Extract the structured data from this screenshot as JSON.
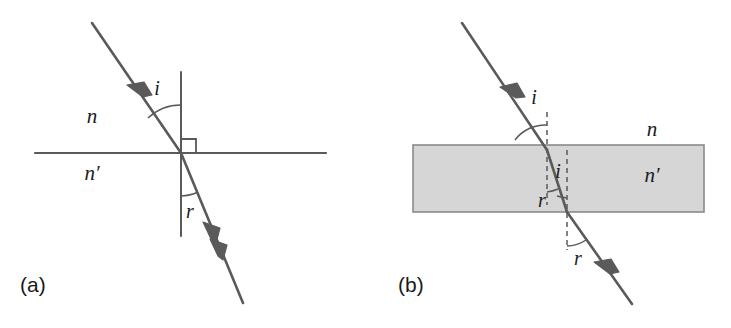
{
  "figure": {
    "width": 731,
    "height": 328,
    "background": "#ffffff",
    "stroke_color": "#5a5a5a",
    "text_color": "#1a1a1a",
    "slab_fill": "#d6d6d6",
    "slab_stroke": "#8a8a8a"
  },
  "panels": [
    {
      "id": "a",
      "caption": "(a)",
      "caption_x": 20,
      "caption_y": 292,
      "description": "Refraction of a ray at a single plane interface between two media",
      "media": [
        {
          "label": "n",
          "x": 92,
          "y": 123,
          "position": "above-interface"
        },
        {
          "label": "n′",
          "x": 92,
          "y": 180,
          "position": "below-interface"
        }
      ],
      "angles": [
        {
          "label": "i",
          "x": 157,
          "y": 95,
          "meaning": "angle-of-incidence"
        },
        {
          "label": "r",
          "x": 190,
          "y": 218,
          "meaning": "angle-of-refraction"
        }
      ],
      "interface_line": {
        "x1": 35,
        "y1": 153,
        "x2": 326,
        "y2": 153
      },
      "normal_line": {
        "x1": 181,
        "y1": 72,
        "x2": 181,
        "y2": 236
      },
      "incident_ray": {
        "x1": 92,
        "y1": 23,
        "x2": 181,
        "y2": 153,
        "arrow_t": 0.52
      },
      "refracted_ray": {
        "x1": 181,
        "y1": 153,
        "x2": 243,
        "y2": 303,
        "arrow_t": 0.46,
        "double_arrow": true
      },
      "right_angle_marker": {
        "x": 182,
        "y": 139,
        "size": 14
      }
    },
    {
      "id": "b",
      "caption": "(b)",
      "caption_x": 398,
      "caption_y": 292,
      "description": "Ray passing through a parallel-sided slab, refracting at entry and exit faces",
      "media": [
        {
          "label": "n",
          "x": 652,
          "y": 136,
          "position": "above-slab"
        },
        {
          "label": "n′",
          "x": 652,
          "y": 182,
          "position": "inside-slab"
        }
      ],
      "angles": [
        {
          "label": "i",
          "x": 534,
          "y": 104,
          "meaning": "angle-of-incidence-top"
        },
        {
          "label": "i",
          "x": 558,
          "y": 178,
          "meaning": "angle-inside-at-exit"
        },
        {
          "label": "r",
          "x": 542,
          "y": 207,
          "meaning": "angle-of-refraction-inside"
        },
        {
          "label": "r",
          "x": 578,
          "y": 265,
          "meaning": "angle-of-emergence"
        }
      ],
      "slab": {
        "x": 413,
        "y": 145,
        "width": 291,
        "height": 67
      },
      "normals": [
        {
          "x": 547,
          "y1": 112,
          "y2": 205,
          "dashed": true
        },
        {
          "x": 567,
          "y1": 150,
          "y2": 250,
          "dashed": true
        }
      ],
      "incident_ray": {
        "x1": 462,
        "y1": 23,
        "x2": 547,
        "y2": 150,
        "arrow_t": 0.58
      },
      "internal_ray": {
        "x1": 547,
        "y1": 150,
        "x2": 567,
        "y2": 212
      },
      "emergent_ray": {
        "x1": 567,
        "y1": 212,
        "x2": 632,
        "y2": 304,
        "arrow_t": 0.55
      }
    }
  ]
}
